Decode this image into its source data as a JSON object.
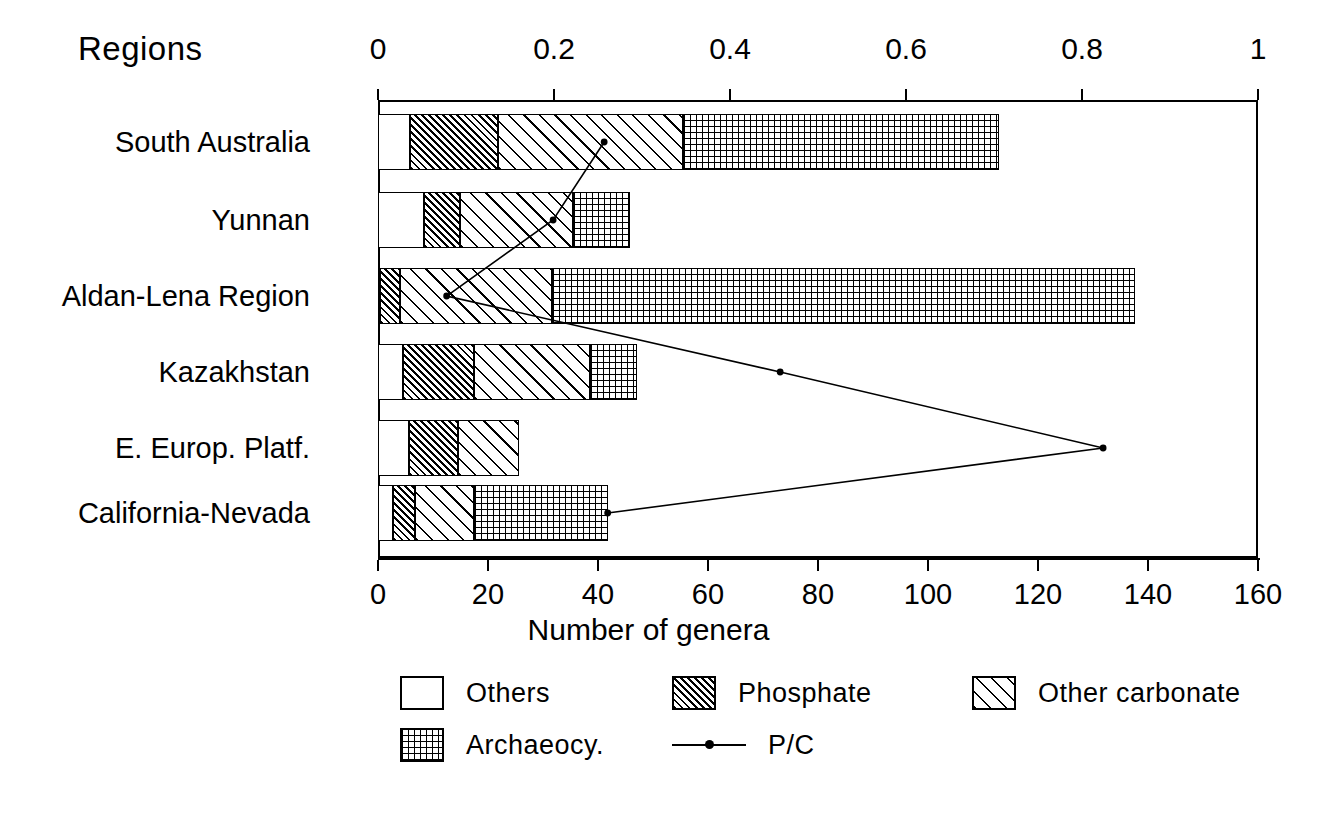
{
  "chart_data": {
    "type": "bar",
    "orientation": "horizontal",
    "stacked": true,
    "title": "",
    "categories_axis_title": "Regions",
    "xlabel": "Number of genera",
    "xlabel_secondary": "",
    "categories": [
      "South Australia",
      "Yunnan",
      "Aldan-Lena Region",
      "Kazakhstan",
      "E. Europ. Platf.",
      "California-Nevada"
    ],
    "series": [
      {
        "name": "Others",
        "values": [
          5.8,
          8.4,
          0.4,
          4.5,
          5.6,
          2.7
        ]
      },
      {
        "name": "Phosphate",
        "values": [
          16.0,
          6.5,
          3.6,
          13.0,
          9.0,
          4.0
        ]
      },
      {
        "name": "Other carbonate",
        "values": [
          33.6,
          20.5,
          27.6,
          21.0,
          11.0,
          10.7
        ]
      },
      {
        "name": "Archaeocy.",
        "values": [
          57.6,
          10.4,
          106.0,
          8.5,
          0.0,
          24.4
        ]
      }
    ],
    "totals": [
      113,
      45.8,
      137.6,
      47,
      25.6,
      41.8
    ],
    "overlay_series": {
      "name": "P/C",
      "values": [
        0.257,
        0.199,
        0.078,
        0.457,
        0.824,
        0.261
      ],
      "axis": "top"
    },
    "x_axis_bottom": {
      "ticks": [
        "0",
        "20",
        "40",
        "60",
        "80",
        "100",
        "120",
        "140",
        "160"
      ],
      "min": 0,
      "max": 160
    },
    "x_axis_top": {
      "ticks": [
        "0",
        "0.2",
        "0.4",
        "0.6",
        "0.8",
        "1"
      ],
      "min": 0,
      "max": 1
    },
    "grid": false,
    "legend_position": "bottom",
    "legend": [
      {
        "label": "Others",
        "pattern": "solid-white"
      },
      {
        "label": "Phosphate",
        "pattern": "dense-diagonal-hatch"
      },
      {
        "label": "Other carbonate",
        "pattern": "sparse-diagonal-hatch"
      },
      {
        "label": "Archaeocy.",
        "pattern": "dotted-grid"
      },
      {
        "label": "P/C",
        "pattern": "line-with-point-marker"
      }
    ],
    "colors": {
      "ink": "#000000",
      "background": "#ffffff"
    }
  }
}
